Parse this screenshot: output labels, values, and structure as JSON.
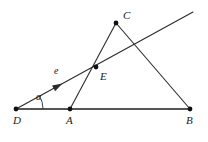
{
  "figure": {
    "type": "euclidean-geometry-diagram",
    "background_color": "#ffffff",
    "stroke_color": "#2b2b2b",
    "baseline_color": "#555555",
    "point_color": "#111111",
    "width": 208,
    "height": 142
  },
  "points": [
    {
      "id": "D",
      "label": "D",
      "x": 16,
      "y": 109,
      "label_x": 13,
      "label_y": 124
    },
    {
      "id": "A",
      "label": "A",
      "x": 70,
      "y": 109,
      "label_x": 66,
      "label_y": 124
    },
    {
      "id": "B",
      "label": "B",
      "x": 190,
      "y": 109,
      "label_x": 186,
      "label_y": 124
    },
    {
      "id": "C",
      "label": "C",
      "x": 116,
      "y": 23,
      "label_x": 123,
      "label_y": 19
    },
    {
      "id": "E",
      "label": "E",
      "x": 96,
      "y": 67,
      "label_x": 100,
      "label_y": 80
    }
  ],
  "segments": [
    {
      "id": "DB",
      "from": "D",
      "to": "B",
      "style": "baseline"
    },
    {
      "id": "AC",
      "from": "A",
      "to": "C",
      "style": "normal"
    },
    {
      "id": "CB",
      "from": "C",
      "to": "B",
      "style": "normal"
    }
  ],
  "ray": {
    "id": "e",
    "label": "e",
    "label_x": 54,
    "label_y": 74,
    "from_x": 16,
    "from_y": 109,
    "to_x": 193,
    "to_y": 12,
    "passes_through": "E",
    "arrow_x": 58,
    "arrow_y": 86,
    "arrow_angle_deg": -28.7
  },
  "angle": {
    "id": "alpha",
    "label": "α",
    "vertex": "D",
    "label_x": 36,
    "label_y": 100,
    "radius": 27,
    "from_deg": 0,
    "to_deg": -28.7
  },
  "accent_colors": {
    "stroke": "#2b2b2b",
    "baseline": "#555555",
    "point": "#111111",
    "text": "#1a1a1a"
  }
}
